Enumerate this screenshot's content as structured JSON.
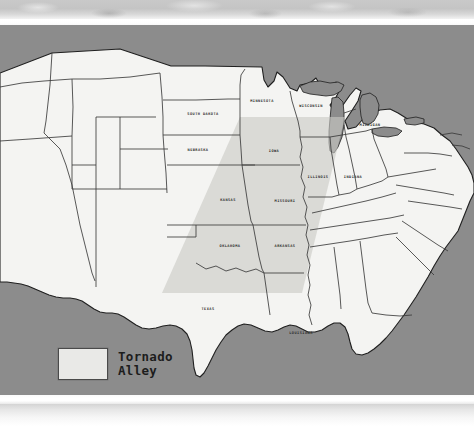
{
  "figure": {
    "kind": "thematic-map"
  },
  "colors": {
    "land": "#f4f4f2",
    "water": "#8c8c8c",
    "ocean": "#8c8c8c",
    "alley_band": "#c9c9c5",
    "state_border": "#3b3b3b",
    "coast_border": "#1f1f1f",
    "label_text": "#2a2a2a",
    "legend_swatch": "#e9e9e7",
    "legend_border": "#4a4a4a",
    "top_texture": "#c4c4c4",
    "page_background": "#ffffff"
  },
  "legend": {
    "title_line_1": "Tornado",
    "title_line_2": "Alley",
    "swatch_label": "tornado-alley-shaded-region"
  },
  "map": {
    "labels": [
      {
        "id": "minnesota",
        "text": "MINNESOTA",
        "x": 262,
        "y": 77,
        "in_alley": false
      },
      {
        "id": "wisconsin",
        "text": "WISCONSIN",
        "x": 311,
        "y": 82,
        "in_alley": false
      },
      {
        "id": "michigan",
        "text": "MICHIGAN",
        "x": 370,
        "y": 101,
        "in_alley": false
      },
      {
        "id": "south-dakota",
        "text": "SOUTH DAKOTA",
        "x": 203,
        "y": 90,
        "in_alley": false
      },
      {
        "id": "nebraska",
        "text": "NEBRASKA",
        "x": 198,
        "y": 126,
        "in_alley": false
      },
      {
        "id": "iowa",
        "text": "IOWA",
        "x": 274,
        "y": 127,
        "in_alley": true
      },
      {
        "id": "illinois",
        "text": "ILLINOIS",
        "x": 318,
        "y": 153,
        "in_alley": true
      },
      {
        "id": "indiana",
        "text": "INDIANA",
        "x": 353,
        "y": 153,
        "in_alley": false
      },
      {
        "id": "kansas",
        "text": "KANSAS",
        "x": 228,
        "y": 176,
        "in_alley": true
      },
      {
        "id": "missouri",
        "text": "MISSOURI",
        "x": 285,
        "y": 177,
        "in_alley": true
      },
      {
        "id": "oklahoma",
        "text": "OKLAHOMA",
        "x": 230,
        "y": 222,
        "in_alley": true
      },
      {
        "id": "arkansas",
        "text": "ARKANSAS",
        "x": 285,
        "y": 222,
        "in_alley": true
      },
      {
        "id": "texas",
        "text": "TEXAS",
        "x": 208,
        "y": 285,
        "in_alley": true
      },
      {
        "id": "louisiana",
        "text": "LOUISIANA",
        "x": 301,
        "y": 309,
        "in_alley": false
      }
    ]
  }
}
